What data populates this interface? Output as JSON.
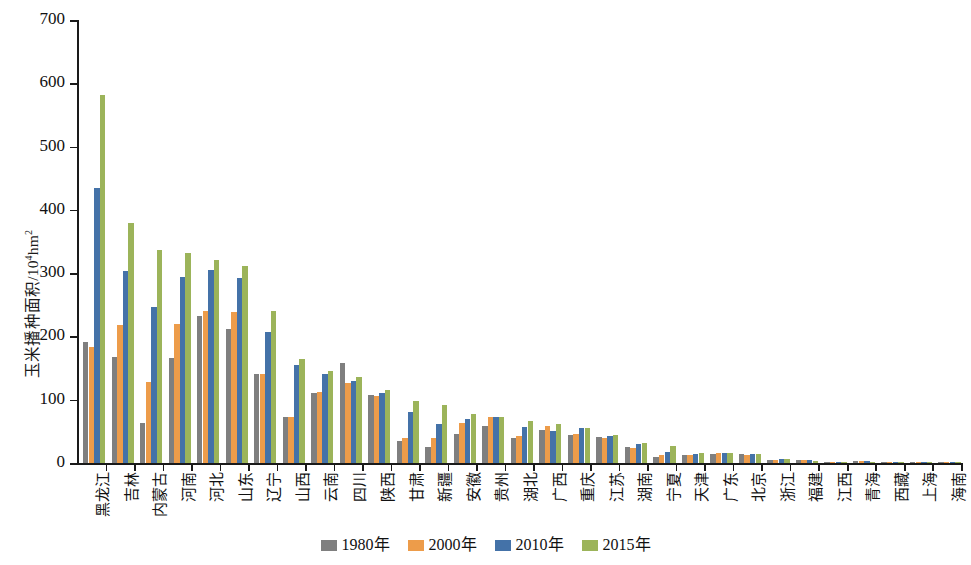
{
  "chart_data": {
    "type": "bar",
    "title": "",
    "xlabel": "",
    "ylabel": "玉米播种面积/10⁴hm²",
    "ylabel_main": "玉米播种面积/10",
    "ylabel_sup": "4",
    "ylabel_tail": "hm",
    "ylabel_tail_sup": "2",
    "ylim": [
      0,
      700
    ],
    "yticks": [
      0,
      100,
      200,
      300,
      400,
      500,
      600,
      700
    ],
    "ytick_labels": [
      "0",
      "100",
      "200",
      "300",
      "400",
      "500",
      "600",
      "700"
    ],
    "grid": false,
    "legend_position": "bottom-center",
    "categories": [
      "黑龙江",
      "吉林",
      "内蒙古",
      "河南",
      "河北",
      "山东",
      "辽宁",
      "山西",
      "云南",
      "四川",
      "陕西",
      "甘肃",
      "新疆",
      "安徽",
      "贵州",
      "湖北",
      "广西",
      "重庆",
      "江苏",
      "湖南",
      "宁夏",
      "天津",
      "广东",
      "北京",
      "浙江",
      "福建",
      "江西",
      "青海",
      "西藏",
      "上海",
      "海南"
    ],
    "series": [
      {
        "name": "1980年",
        "color": "#7f7f7f",
        "values": [
          192,
          168,
          64,
          166,
          233,
          212,
          140,
          72,
          110,
          158,
          108,
          35,
          26,
          46,
          58,
          40,
          52,
          44,
          41,
          25,
          9,
          12,
          15,
          14,
          5,
          4,
          2,
          3,
          1,
          1,
          0.5
        ]
      },
      {
        "name": "2000年",
        "color": "#ed9c4a",
        "values": [
          183,
          218,
          128,
          219,
          240,
          239,
          140,
          72,
          112,
          127,
          106,
          40,
          39,
          63,
          72,
          42,
          58,
          46,
          40,
          23,
          12,
          13,
          16,
          13,
          5,
          4,
          2,
          3,
          1,
          1,
          0.5
        ]
      },
      {
        "name": "2010年",
        "color": "#4472a8",
        "values": [
          434,
          303,
          247,
          294,
          305,
          293,
          207,
          155,
          140,
          130,
          110,
          80,
          62,
          70,
          73,
          57,
          51,
          55,
          43,
          30,
          18,
          14,
          16,
          14,
          6,
          4,
          2,
          3,
          1,
          1,
          0.5
        ]
      },
      {
        "name": "2015年",
        "color": "#9cb45a",
        "values": [
          581,
          380,
          337,
          332,
          321,
          312,
          240,
          164,
          145,
          136,
          116,
          98,
          92,
          77,
          73,
          66,
          61,
          56,
          44,
          32,
          27,
          16,
          16,
          14,
          6,
          3,
          2,
          2,
          1,
          1,
          0.5
        ]
      }
    ]
  },
  "legend": {
    "items": [
      {
        "label": "1980年",
        "color": "#7f7f7f"
      },
      {
        "label": "2000年",
        "color": "#ed9c4a"
      },
      {
        "label": "2010年",
        "color": "#4472a8"
      },
      {
        "label": "2015年",
        "color": "#9cb45a"
      }
    ]
  }
}
